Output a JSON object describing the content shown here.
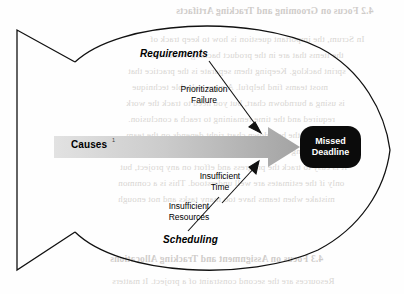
{
  "diagram": {
    "type": "fishbone-cause-and-effect",
    "spine_arrow": {
      "label": "Causes",
      "superscript": "1",
      "icon": "right-arrow-icon",
      "gradient_from": "#dedede",
      "gradient_to": "#a5a5a5"
    },
    "effect": {
      "line1": "Missed",
      "line2": "Deadline",
      "background_color": "#0b0b0b",
      "text_color": "#ffffff"
    },
    "categories": [
      {
        "name": "Requirements",
        "position": "upper",
        "causes": [
          {
            "line1": "Prioritization",
            "line2": "Failure"
          }
        ]
      },
      {
        "name": "Scheduling",
        "position": "lower",
        "causes": [
          {
            "line1": "Insufficient",
            "line2": "Time"
          },
          {
            "line1": "Insufficient",
            "line2": "Resources"
          }
        ]
      }
    ]
  },
  "background_bleed_text": {
    "note": "faint mirrored show-through from the reverse side of the scanned page",
    "lines": [
      {
        "text": "4.2  Focus on Grooming and Tracking Artifacts",
        "x": 176,
        "y": 6,
        "heading": true
      },
      {
        "text": "In Scrum, the important question is how to keep track of",
        "x": 150,
        "y": 34,
        "heading": false
      },
      {
        "text": "the items that are in the product backlog versus the",
        "x": 150,
        "y": 50,
        "heading": false
      },
      {
        "text": "sprint backlog. Keeping them separate is the practice that",
        "x": 128,
        "y": 66,
        "heading": false
      },
      {
        "text": "most teams find helpful. A more valuable technique",
        "x": 132,
        "y": 82,
        "heading": false
      },
      {
        "text": "is using a burndown chart, but you need to track the work",
        "x": 126,
        "y": 98,
        "heading": false
      },
      {
        "text": "required and the time remaining to reach a conclusion.",
        "x": 128,
        "y": 114,
        "heading": false
      },
      {
        "text": "Getting the burndown chart right depends on the team",
        "x": 126,
        "y": 130,
        "heading": false
      },
      {
        "text": "knowing the story points and velocity of the sprint.",
        "x": 130,
        "y": 146,
        "heading": false
      },
      {
        "text": "It is easy to track the progress and effort on any project, but",
        "x": 120,
        "y": 162,
        "heading": false
      },
      {
        "text": "only if the estimates are well understood. This is a common",
        "x": 118,
        "y": 178,
        "heading": false
      },
      {
        "text": "mistake when teams have too many tasks and not enough",
        "x": 118,
        "y": 194,
        "heading": false
      },
      {
        "text": "4.3  Focus on Assignment and Tracking Allocations",
        "x": 110,
        "y": 254,
        "heading": true
      },
      {
        "text": "Resources are the second constraint of a project. It matters",
        "x": 112,
        "y": 276,
        "heading": false
      }
    ]
  }
}
